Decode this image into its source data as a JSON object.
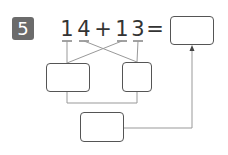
{
  "problem": {
    "number": "5",
    "equation": {
      "tokens": [
        {
          "text": "1",
          "x": 67
        },
        {
          "text": "4",
          "x": 84
        },
        {
          "text": "+",
          "x": 103
        },
        {
          "text": "1",
          "x": 122
        },
        {
          "text": "3",
          "x": 138
        },
        {
          "text": "=",
          "x": 155
        }
      ]
    },
    "answer_box": {
      "value": ""
    },
    "tens_box": {
      "value": ""
    },
    "ones_box": {
      "value": ""
    },
    "sum_box": {
      "value": ""
    }
  },
  "colors": {
    "badge": "#6b6b6b",
    "text": "#333333",
    "lines": "#999999",
    "box_border": "#555555"
  }
}
